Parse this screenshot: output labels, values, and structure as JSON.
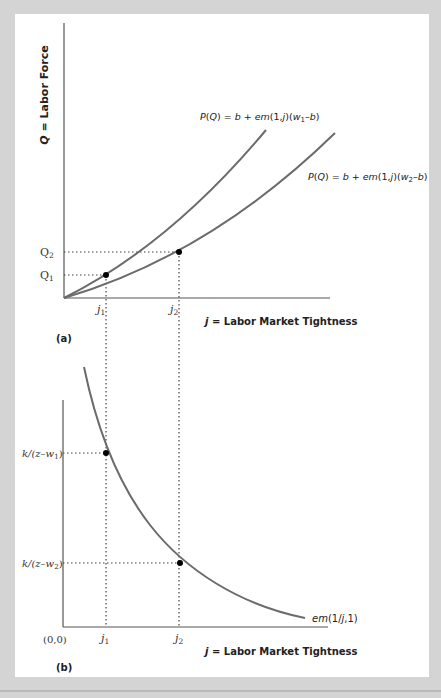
{
  "figure": {
    "panel_a": {
      "label": "(a)",
      "y_axis_label": "Q = Labor Force",
      "y_axis_var": "Q",
      "y_axis_text": " = Labor Force",
      "x_axis_var": "j",
      "x_axis_text": " = Labor Market Tightness",
      "y_ticks": [
        "Q2",
        "Q1"
      ],
      "x_ticks": [
        "j1",
        "j2"
      ],
      "curves": [
        {
          "name": "upper",
          "label_prefix": "P(Q) = b + em(1,j)(w",
          "label_sub": "1",
          "label_suffix": "–b)"
        },
        {
          "name": "lower",
          "label_prefix": "P(Q) = b + em(1,j)(w",
          "label_sub": "2",
          "label_suffix": "–b)"
        }
      ]
    },
    "panel_b": {
      "label": "(b)",
      "origin_label": "(0,0)",
      "x_axis_var": "j",
      "x_axis_text": " = Labor Market Tightness",
      "y_ticks": [
        {
          "prefix": "k/(z–w",
          "sub": "1",
          "suffix": ")"
        },
        {
          "prefix": "k/(z–w",
          "sub": "2",
          "suffix": ")"
        }
      ],
      "x_ticks": [
        "j1",
        "j2"
      ],
      "curve_label": "em(1/j,1)"
    },
    "colors": {
      "curve": "#6b6b6b",
      "axis": "#555555",
      "point": "#000000",
      "background": "#d4d4d4",
      "panel": "#ffffff"
    }
  }
}
